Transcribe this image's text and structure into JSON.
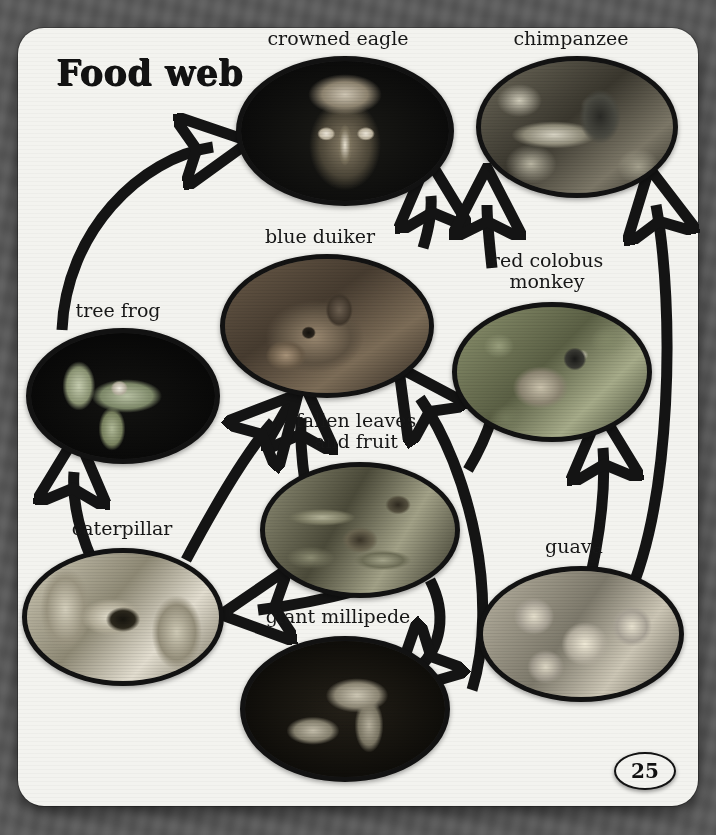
{
  "page": {
    "title": "Food web",
    "page_number": "25",
    "background_style": "blurred-greyscale-foliage",
    "card_color": "#f3f3ef",
    "ink_color": "#121212"
  },
  "organisms": [
    {
      "id": "crowned-eagle",
      "label": "crowned eagle",
      "photo": "ph-eagle"
    },
    {
      "id": "chimpanzee",
      "label": "chimpanzee",
      "photo": "ph-chimp"
    },
    {
      "id": "blue-duiker",
      "label": "blue duiker",
      "photo": "ph-duiker"
    },
    {
      "id": "red-colobus",
      "label_line1": "red colobus",
      "label_line2": "monkey",
      "photo": "ph-colobus"
    },
    {
      "id": "tree-frog",
      "label": "tree frog",
      "photo": "ph-frog"
    },
    {
      "id": "caterpillar",
      "label": "caterpillar",
      "photo": "ph-cater"
    },
    {
      "id": "fallen-leaves",
      "label_line1": "fallen leaves",
      "label_line2": "and fruit",
      "photo": "ph-leaves"
    },
    {
      "id": "giant-millipede",
      "label": "giant millipede",
      "photo": "ph-milli"
    },
    {
      "id": "guava",
      "label": "guava",
      "photo": "ph-guava"
    }
  ],
  "food_web_links": [
    {
      "from": "tree-frog",
      "to": "crowned-eagle"
    },
    {
      "from": "blue-duiker",
      "to": "crowned-eagle"
    },
    {
      "from": "red-colobus",
      "to": "chimpanzee"
    },
    {
      "from": "guava",
      "to": "chimpanzee"
    },
    {
      "from": "guava",
      "to": "red-colobus"
    },
    {
      "from": "fallen-leaves",
      "to": "blue-duiker"
    },
    {
      "from": "caterpillar",
      "to": "tree-frog"
    },
    {
      "from": "fallen-leaves",
      "to": "caterpillar"
    },
    {
      "from": "fallen-leaves",
      "to": "giant-millipede"
    },
    {
      "from": "giant-millipede",
      "to": "blue-duiker"
    },
    {
      "from": "caterpillar",
      "to": "blue-duiker"
    }
  ]
}
